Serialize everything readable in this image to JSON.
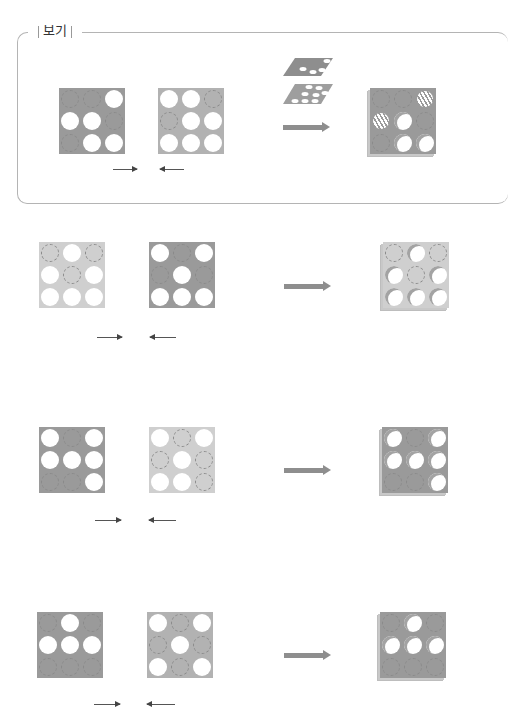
{
  "box": {
    "label": "보기"
  },
  "legend": {
    "hole": "white circle (cut-out)",
    "dash": "dashed circle (no hole)",
    "hatch": "hatched (partially covered)"
  },
  "example": {
    "card_a": {
      "shade": "dark",
      "cells": [
        "dash",
        "dash",
        "hole",
        "hole",
        "hole",
        "dash",
        "dash",
        "hole",
        "hole"
      ]
    },
    "card_b": {
      "shade": "mid",
      "cells": [
        "hole",
        "hole",
        "dash",
        "dash",
        "hole",
        "hole",
        "hole",
        "hole",
        "hole"
      ]
    },
    "result": {
      "shade": "dark",
      "cells": [
        "dash",
        "dash",
        "hatch",
        "hatch",
        "hole",
        "dash",
        "dash",
        "hole",
        "hole"
      ]
    },
    "arrow_icon": "arrow-right-icon",
    "stack_icon": "stacked-layers-icon"
  },
  "options": [
    {
      "card_a": {
        "shade": "light",
        "cells": [
          "dash",
          "hole",
          "dash",
          "hole",
          "dash",
          "hole",
          "hole",
          "hole",
          "hole"
        ]
      },
      "card_b": {
        "shade": "dark",
        "cells": [
          "hole",
          "dash",
          "hole",
          "dash",
          "hole",
          "dash",
          "hole",
          "hole",
          "hole"
        ]
      },
      "result": {
        "shade": "light",
        "cells": [
          "dash",
          "hole",
          "dash",
          "hole",
          "dash",
          "hole",
          "hole",
          "hole",
          "hole"
        ]
      }
    },
    {
      "card_a": {
        "shade": "dark",
        "cells": [
          "hole",
          "dash",
          "hole",
          "hole",
          "hole",
          "hole",
          "dash",
          "dash",
          "hole"
        ]
      },
      "card_b": {
        "shade": "light",
        "cells": [
          "hole",
          "dash",
          "hole",
          "dash",
          "hole",
          "dash",
          "hole",
          "hole",
          "dash"
        ]
      },
      "result": {
        "shade": "dark",
        "cells": [
          "hole",
          "dash",
          "hole",
          "hole",
          "hole",
          "hole",
          "dash",
          "dash",
          "hole"
        ]
      }
    },
    {
      "card_a": {
        "shade": "dark",
        "cells": [
          "dash",
          "hole",
          "dash",
          "hole",
          "hole",
          "hole",
          "dash",
          "dash",
          "dash"
        ]
      },
      "card_b": {
        "shade": "mid",
        "cells": [
          "hole",
          "dash",
          "hole",
          "dash",
          "hole",
          "dash",
          "hole",
          "dash",
          "hole"
        ]
      },
      "result": {
        "shade": "dark",
        "cells": [
          "dash",
          "hole",
          "dash",
          "hole",
          "hole",
          "hole",
          "dash",
          "dash",
          "dash"
        ]
      }
    }
  ]
}
